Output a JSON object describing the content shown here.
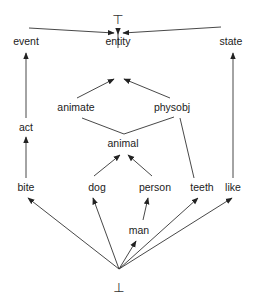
{
  "diagram": {
    "type": "type-hierarchy-lattice",
    "top_symbol": "⊤",
    "bottom_symbol": "⊥",
    "nodes": {
      "event": "event",
      "entity": "entity",
      "state": "state",
      "act": "act",
      "animate": "animate",
      "physobj": "physobj",
      "animal": "animal",
      "bite": "bite",
      "dog": "dog",
      "person": "person",
      "teeth": "teeth",
      "like": "like",
      "man": "man"
    },
    "edges": [
      {
        "from": "event",
        "to": "top",
        "arrow": true
      },
      {
        "from": "entity",
        "to": "top",
        "arrow": true
      },
      {
        "from": "state",
        "to": "top",
        "arrow": true
      },
      {
        "from": "act",
        "to": "event",
        "arrow": true
      },
      {
        "from": "animate",
        "to": "entity",
        "arrow": true
      },
      {
        "from": "physobj",
        "to": "entity",
        "arrow": true
      },
      {
        "from": "animal",
        "to": "animate",
        "arrow": false
      },
      {
        "from": "animal",
        "to": "physobj",
        "arrow": false
      },
      {
        "from": "teeth",
        "to": "physobj",
        "arrow": false
      },
      {
        "from": "like",
        "to": "state",
        "arrow": false
      },
      {
        "from": "bite",
        "to": "act",
        "arrow": true
      },
      {
        "from": "dog",
        "to": "animal",
        "arrow": true
      },
      {
        "from": "person",
        "to": "animal",
        "arrow": true
      },
      {
        "from": "man",
        "to": "person",
        "arrow": true
      },
      {
        "from": "bottom",
        "to": "bite",
        "arrow": true
      },
      {
        "from": "bottom",
        "to": "dog",
        "arrow": true
      },
      {
        "from": "bottom",
        "to": "man",
        "arrow": true
      },
      {
        "from": "bottom",
        "to": "teeth",
        "arrow": true
      },
      {
        "from": "bottom",
        "to": "like",
        "arrow": true
      }
    ]
  }
}
